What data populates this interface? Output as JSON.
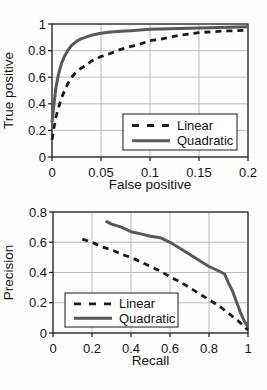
{
  "colors": {
    "grid": "#b4b4b4",
    "axis": "#1a1a1a",
    "text": "#141414",
    "legend_bg": "#ffffff",
    "linear_line": "#1c1c1c",
    "quadratic_line": "#585858"
  },
  "chart_data": [
    {
      "id": "roc",
      "type": "line",
      "title": "",
      "xlabel": "False positive",
      "ylabel": "True positive",
      "xlim": [
        0,
        0.2
      ],
      "ylim": [
        0,
        1
      ],
      "xticks": [
        0,
        0.05,
        0.1,
        0.15,
        0.2
      ],
      "xtick_labels": [
        "0",
        "0.05",
        "0.1",
        "0.15",
        "0.2"
      ],
      "yticks": [
        0,
        0.2,
        0.4,
        0.6,
        0.8,
        1
      ],
      "ytick_labels": [
        "0",
        "0.2",
        "0.4",
        "0.6",
        "0.8",
        "1"
      ],
      "grid": true,
      "legend_position": "inside-lower-right",
      "series": [
        {
          "name": "Linear",
          "style": "dashed",
          "color": "#1c1c1c",
          "width": 2.8,
          "points": [
            [
              0,
              0.13
            ],
            [
              0.002,
              0.22
            ],
            [
              0.004,
              0.3
            ],
            [
              0.007,
              0.38
            ],
            [
              0.01,
              0.45
            ],
            [
              0.013,
              0.5
            ],
            [
              0.016,
              0.55
            ],
            [
              0.02,
              0.6
            ],
            [
              0.025,
              0.64
            ],
            [
              0.03,
              0.67
            ],
            [
              0.035,
              0.69
            ],
            [
              0.04,
              0.72
            ],
            [
              0.05,
              0.755
            ],
            [
              0.06,
              0.78
            ],
            [
              0.07,
              0.81
            ],
            [
              0.08,
              0.83
            ],
            [
              0.09,
              0.85
            ],
            [
              0.1,
              0.875
            ],
            [
              0.11,
              0.885
            ],
            [
              0.12,
              0.9
            ],
            [
              0.13,
              0.915
            ],
            [
              0.14,
              0.925
            ],
            [
              0.15,
              0.935
            ],
            [
              0.16,
              0.94
            ],
            [
              0.17,
              0.945
            ],
            [
              0.18,
              0.948
            ],
            [
              0.19,
              0.95
            ],
            [
              0.2,
              0.955
            ]
          ]
        },
        {
          "name": "Quadratic",
          "style": "solid",
          "color": "#585858",
          "width": 3,
          "points": [
            [
              0,
              0.26
            ],
            [
              0.002,
              0.4
            ],
            [
              0.004,
              0.52
            ],
            [
              0.006,
              0.6
            ],
            [
              0.008,
              0.66
            ],
            [
              0.01,
              0.71
            ],
            [
              0.013,
              0.76
            ],
            [
              0.016,
              0.8
            ],
            [
              0.02,
              0.84
            ],
            [
              0.025,
              0.87
            ],
            [
              0.03,
              0.89
            ],
            [
              0.04,
              0.915
            ],
            [
              0.05,
              0.93
            ],
            [
              0.06,
              0.94
            ],
            [
              0.07,
              0.945
            ],
            [
              0.08,
              0.95
            ],
            [
              0.1,
              0.96
            ],
            [
              0.12,
              0.965
            ],
            [
              0.15,
              0.97
            ],
            [
              0.18,
              0.975
            ],
            [
              0.2,
              0.98
            ]
          ]
        }
      ]
    },
    {
      "id": "precision-recall",
      "type": "line",
      "title": "",
      "xlabel": "Recall",
      "ylabel": "Precision",
      "xlim": [
        0,
        1
      ],
      "ylim": [
        0,
        0.8
      ],
      "xticks": [
        0,
        0.2,
        0.4,
        0.6,
        0.8,
        1
      ],
      "xtick_labels": [
        "0",
        "0.2",
        "0.4",
        "0.6",
        "0.8",
        "1"
      ],
      "yticks": [
        0,
        0.2,
        0.4,
        0.6,
        0.8
      ],
      "ytick_labels": [
        "0",
        "0.2",
        "0.4",
        "0.6",
        "0.8"
      ],
      "grid": true,
      "legend_position": "inside-lower-left",
      "series": [
        {
          "name": "Linear",
          "style": "dashed",
          "color": "#1c1c1c",
          "width": 2.8,
          "points": [
            [
              0.15,
              0.62
            ],
            [
              0.2,
              0.6
            ],
            [
              0.25,
              0.57
            ],
            [
              0.3,
              0.55
            ],
            [
              0.35,
              0.52
            ],
            [
              0.4,
              0.5
            ],
            [
              0.45,
              0.47
            ],
            [
              0.5,
              0.44
            ],
            [
              0.55,
              0.41
            ],
            [
              0.6,
              0.37
            ],
            [
              0.65,
              0.34
            ],
            [
              0.7,
              0.3
            ],
            [
              0.75,
              0.26
            ],
            [
              0.8,
              0.22
            ],
            [
              0.85,
              0.18
            ],
            [
              0.9,
              0.13
            ],
            [
              0.95,
              0.08
            ],
            [
              1,
              0.02
            ]
          ]
        },
        {
          "name": "Quadratic",
          "style": "solid",
          "color": "#585858",
          "width": 3,
          "points": [
            [
              0.27,
              0.74
            ],
            [
              0.3,
              0.72
            ],
            [
              0.35,
              0.7
            ],
            [
              0.4,
              0.67
            ],
            [
              0.45,
              0.655
            ],
            [
              0.5,
              0.64
            ],
            [
              0.55,
              0.63
            ],
            [
              0.6,
              0.6
            ],
            [
              0.65,
              0.56
            ],
            [
              0.7,
              0.52
            ],
            [
              0.75,
              0.48
            ],
            [
              0.8,
              0.44
            ],
            [
              0.85,
              0.41
            ],
            [
              0.88,
              0.39
            ],
            [
              0.9,
              0.33
            ],
            [
              0.92,
              0.28
            ],
            [
              0.94,
              0.21
            ],
            [
              0.96,
              0.14
            ],
            [
              0.98,
              0.08
            ],
            [
              1,
              0.04
            ]
          ]
        }
      ]
    }
  ]
}
